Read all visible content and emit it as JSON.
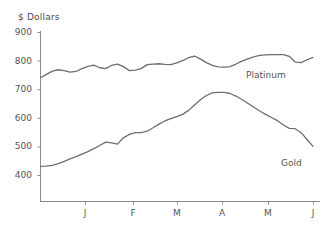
{
  "chart_data": {
    "type": "line",
    "title": "",
    "ylabel": "$ Dollars",
    "xlabel": "",
    "ylim": [
      330,
      900
    ],
    "yticks": [
      900,
      800,
      700,
      600,
      500,
      400
    ],
    "xticks": [
      "J",
      "F",
      "M",
      "A",
      "M",
      "J"
    ],
    "xtick_positions": [
      85,
      133,
      177,
      222,
      268,
      313
    ],
    "grid": false,
    "legend_position": "inline-right",
    "x": [
      0,
      1,
      2,
      3,
      4,
      5,
      6,
      7,
      8,
      9,
      10,
      11,
      12,
      13,
      14,
      15,
      16,
      17,
      18,
      19,
      20,
      21,
      22,
      23,
      24,
      25,
      26,
      27,
      28,
      29,
      30,
      31,
      32,
      33,
      34,
      35,
      36,
      37,
      38,
      39,
      40,
      41,
      42,
      43,
      44,
      45,
      46
    ],
    "series": [
      {
        "name": "Platinum",
        "color": "#6e6e6e",
        "values": [
          740,
          752,
          763,
          768,
          765,
          760,
          762,
          772,
          780,
          784,
          775,
          772,
          783,
          788,
          779,
          765,
          767,
          772,
          786,
          788,
          789,
          787,
          786,
          792,
          800,
          810,
          816,
          805,
          793,
          783,
          778,
          777,
          779,
          788,
          798,
          806,
          813,
          818,
          820,
          821,
          821,
          821,
          815,
          795,
          793,
          803,
          811
        ]
      },
      {
        "name": "Gold",
        "color": "#6e6e6e",
        "values": [
          430,
          431,
          434,
          440,
          448,
          456,
          464,
          473,
          482,
          492,
          503,
          515,
          512,
          508,
          530,
          542,
          548,
          548,
          553,
          565,
          578,
          589,
          597,
          604,
          612,
          626,
          645,
          663,
          678,
          687,
          689,
          689,
          685,
          676,
          664,
          651,
          637,
          624,
          612,
          601,
          590,
          575,
          563,
          562,
          548,
          524,
          500
        ]
      }
    ],
    "annotations": [
      {
        "text": "Platinum",
        "series": "Platinum"
      },
      {
        "text": "Gold",
        "series": "Gold"
      }
    ]
  },
  "axis": {
    "ylabel": "$ Dollars",
    "yticks": [
      "900",
      "800",
      "700",
      "600",
      "500",
      "400"
    ],
    "xticks": [
      "J",
      "F",
      "M",
      "A",
      "M",
      "J"
    ]
  },
  "labels": {
    "platinum": "Platinum",
    "gold": "Gold"
  },
  "colors": {
    "line": "#6e6e6e",
    "axis": "#8a8a8a",
    "text": "#555555",
    "background": "#ffffff"
  }
}
